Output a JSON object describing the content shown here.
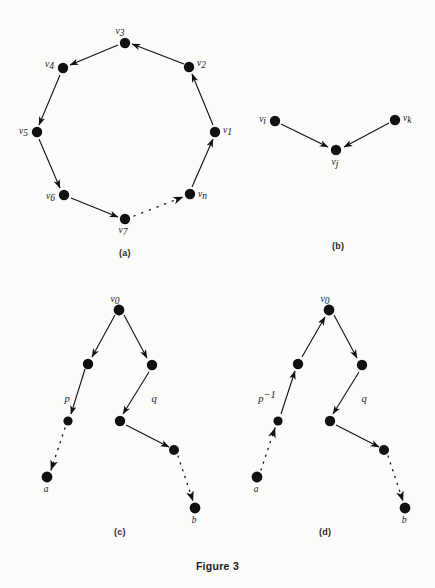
{
  "figure": {
    "caption": "Figure 3",
    "background_color": "#fbfbfa",
    "ink_color": "#111111"
  },
  "panels": [
    {
      "id": "a",
      "label": "(a)",
      "type": "directed-cycle",
      "description": "Directed cycle on n vertices drawn as an octagon with a dotted segment between v7 and vn",
      "vertices": [
        {
          "name": "v",
          "sub": "3",
          "x": 117,
          "y": 35,
          "label_dx": -3,
          "label_dy": -9,
          "anchor": "middle"
        },
        {
          "name": "v",
          "sub": "2",
          "x": 181,
          "y": 59,
          "label_dx": 8,
          "label_dy": -1,
          "anchor": "start"
        },
        {
          "name": "v",
          "sub": "1",
          "x": 207,
          "y": 124,
          "label_dx": 8,
          "label_dy": 1,
          "anchor": "start"
        },
        {
          "name": "v",
          "sub": "n",
          "x": 182,
          "y": 186,
          "label_dx": 8,
          "label_dy": 3,
          "anchor": "start"
        },
        {
          "name": "v",
          "sub": "7",
          "x": 117,
          "y": 211,
          "label_dx": -2,
          "label_dy": 14,
          "anchor": "middle"
        },
        {
          "name": "v",
          "sub": "6",
          "x": 56,
          "y": 187,
          "label_dx": -9,
          "label_dy": 4,
          "anchor": "end"
        },
        {
          "name": "v",
          "sub": "5",
          "x": 29,
          "y": 124,
          "label_dx": -9,
          "label_dy": 2,
          "anchor": "end"
        },
        {
          "name": "v",
          "sub": "4",
          "x": 55,
          "y": 60,
          "label_dx": -9,
          "label_dy": -1,
          "anchor": "end"
        }
      ],
      "edges": [
        {
          "from": "v2",
          "to": "v3",
          "style": "solid"
        },
        {
          "from": "v3",
          "to": "v4",
          "style": "solid"
        },
        {
          "from": "v4",
          "to": "v5",
          "style": "solid"
        },
        {
          "from": "v5",
          "to": "v6",
          "style": "solid"
        },
        {
          "from": "v6",
          "to": "v7",
          "style": "solid"
        },
        {
          "from": "v7",
          "to": "vn",
          "style": "dotted"
        },
        {
          "from": "vn",
          "to": "v1",
          "style": "solid"
        },
        {
          "from": "v1",
          "to": "v2",
          "style": "solid"
        }
      ]
    },
    {
      "id": "b",
      "label": "(b)",
      "type": "in-degree-two",
      "description": "Two edges converging on vj from vi and vk",
      "vertices": [
        {
          "name": "v",
          "sub": "i",
          "x": 30,
          "y": 26,
          "label_dx": -9,
          "label_dy": 1,
          "anchor": "end"
        },
        {
          "name": "v",
          "sub": "j",
          "x": 91,
          "y": 55,
          "label_dx": -1,
          "label_dy": 15,
          "anchor": "middle"
        },
        {
          "name": "v",
          "sub": "k",
          "x": 150,
          "y": 25,
          "label_dx": 8,
          "label_dy": 1,
          "anchor": "start"
        }
      ],
      "edges": [
        {
          "from": "vi",
          "to": "vj",
          "style": "solid"
        },
        {
          "from": "vk",
          "to": "vj",
          "style": "solid"
        }
      ]
    },
    {
      "id": "c",
      "label": "(c)",
      "type": "two-paths-from-v0",
      "description": "Path p from v0 to a on the left and path q from v0 to b on the right, both directed away from v0",
      "path_labels": [
        {
          "text": "p",
          "sup": "",
          "x": 37,
          "y": 103
        },
        {
          "text": "q",
          "sup": "",
          "x": 124,
          "y": 103
        }
      ],
      "vertices": [
        {
          "name": "v",
          "sub": "0",
          "x": 89,
          "y": 15,
          "label_dx": -2,
          "label_dy": -9,
          "anchor": "middle"
        },
        {
          "name": "",
          "sub": "",
          "x": 58,
          "y": 69,
          "label_dx": 0,
          "label_dy": 0,
          "anchor": "middle"
        },
        {
          "name": "",
          "sub": "",
          "x": 38,
          "y": 126,
          "label_dx": 0,
          "label_dy": 0,
          "anchor": "middle"
        },
        {
          "name": "a",
          "sub": "",
          "x": 17,
          "y": 182,
          "label_dx": -1,
          "label_dy": 15,
          "anchor": "middle"
        },
        {
          "name": "",
          "sub": "",
          "x": 122,
          "y": 70,
          "label_dx": 0,
          "label_dy": 0,
          "anchor": "middle"
        },
        {
          "name": "",
          "sub": "",
          "x": 90,
          "y": 126,
          "label_dx": 0,
          "label_dy": 0,
          "anchor": "middle"
        },
        {
          "name": "",
          "sub": "",
          "x": 144,
          "y": 155,
          "label_dx": 0,
          "label_dy": 0,
          "anchor": "middle"
        },
        {
          "name": "b",
          "sub": "",
          "x": 165,
          "y": 213,
          "label_dx": -1,
          "label_dy": 15,
          "anchor": "middle"
        }
      ]
    },
    {
      "id": "d",
      "label": "(d)",
      "type": "reversed-left-path",
      "description": "Same as (c) but the left path is reversed and labelled p to the minus one, arrows point from a up to v0",
      "path_labels": [
        {
          "text": "p",
          "sup": "−1",
          "x": 32,
          "y": 103
        },
        {
          "text": "q",
          "sup": "",
          "x": 124,
          "y": 103
        }
      ],
      "vertices": [
        {
          "name": "v",
          "sub": "0",
          "x": 94,
          "y": 15,
          "label_dx": -2,
          "label_dy": -9,
          "anchor": "middle"
        },
        {
          "name": "",
          "sub": "",
          "x": 63,
          "y": 69,
          "label_dx": 0,
          "label_dy": 0,
          "anchor": "middle"
        },
        {
          "name": "",
          "sub": "",
          "x": 43,
          "y": 126,
          "label_dx": 0,
          "label_dy": 0,
          "anchor": "middle"
        },
        {
          "name": "a",
          "sub": "",
          "x": 22,
          "y": 182,
          "label_dx": -1,
          "label_dy": 15,
          "anchor": "middle"
        },
        {
          "name": "",
          "sub": "",
          "x": 127,
          "y": 70,
          "label_dx": 0,
          "label_dy": 0,
          "anchor": "middle"
        },
        {
          "name": "",
          "sub": "",
          "x": 95,
          "y": 126,
          "label_dx": 0,
          "label_dy": 0,
          "anchor": "middle"
        },
        {
          "name": "",
          "sub": "",
          "x": 149,
          "y": 155,
          "label_dx": 0,
          "label_dy": 0,
          "anchor": "middle"
        },
        {
          "name": "b",
          "sub": "",
          "x": 170,
          "y": 213,
          "label_dx": -1,
          "label_dy": 15,
          "anchor": "middle"
        }
      ]
    }
  ]
}
